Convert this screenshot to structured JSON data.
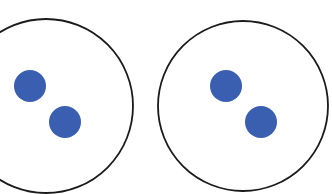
{
  "diagram": {
    "colors": {
      "outline": "#1a1a1a",
      "dot": "#3a5fb0",
      "background": "#ffffff"
    },
    "circles": [
      {
        "label": "left-container",
        "cx": 46,
        "cy": 106,
        "r": 87,
        "dots": [
          {
            "cx": 30,
            "cy": 86,
            "r": 16
          },
          {
            "cx": 65,
            "cy": 122,
            "r": 16
          }
        ]
      },
      {
        "label": "right-container",
        "cx": 243,
        "cy": 106,
        "r": 85,
        "dots": [
          {
            "cx": 226,
            "cy": 86,
            "r": 16
          },
          {
            "cx": 261,
            "cy": 122,
            "r": 16
          }
        ]
      }
    ]
  }
}
